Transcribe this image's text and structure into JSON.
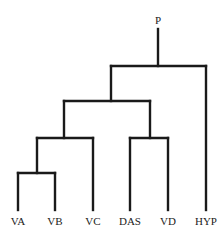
{
  "diagram": {
    "type": "dendrogram",
    "root_label": "P",
    "leaves": [
      "VA",
      "VB",
      "VC",
      "DAS",
      "VD",
      "HYP"
    ],
    "structure": "(((VA,VB),VC),(DAS,VD)),HYP"
  }
}
